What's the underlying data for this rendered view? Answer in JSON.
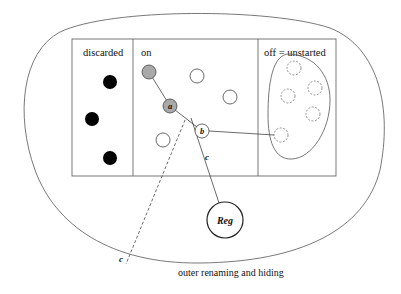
{
  "diagram": {
    "panels": {
      "discarded": {
        "label": "discarded"
      },
      "on": {
        "label": "on"
      },
      "off": {
        "label": "off = unstarted"
      }
    },
    "nodes": {
      "a": {
        "label": "a",
        "state": "active"
      },
      "b": {
        "label": "b",
        "state": "connected"
      },
      "reg": {
        "label": "Reg"
      }
    },
    "edges": {
      "solid_c": {
        "label": "c"
      },
      "dashed_c": {
        "label": "c"
      }
    },
    "outer_label": "outer renaming and hiding",
    "colors": {
      "stroke": "#444444",
      "discarded_fill": "#000000",
      "active_fill": "#a9a9a9",
      "idle_fill": "#ffffff"
    }
  }
}
